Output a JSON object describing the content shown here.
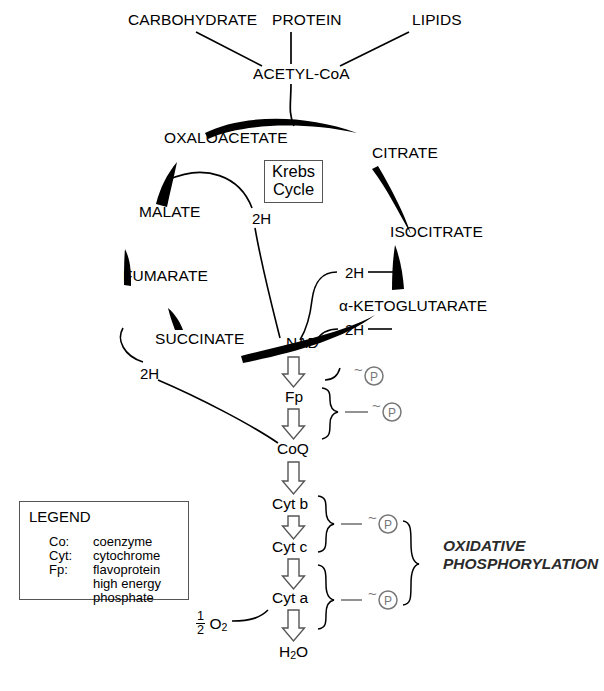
{
  "diagram": {
    "center_box": {
      "line1": "Krebs",
      "line2": "Cycle"
    },
    "inputs": [
      {
        "name": "carbohydrate",
        "label": "CARBOHYDRATE",
        "x": 128,
        "y": 19
      },
      {
        "name": "protein",
        "label": "PROTEIN",
        "x": 272,
        "y": 19
      },
      {
        "name": "lipids",
        "label": "LIPIDS",
        "x": 412,
        "y": 19
      }
    ],
    "acetyl_coa": {
      "label": "ACETYL-CoA",
      "x": 253,
      "y": 73
    },
    "cycle_intermediates": [
      {
        "name": "oxaloacetate",
        "label": "OXALOACETATE",
        "x": 164,
        "y": 137
      },
      {
        "name": "citrate",
        "label": "CITRATE",
        "x": 372,
        "y": 152
      },
      {
        "name": "malate",
        "label": "MALATE",
        "x": 139,
        "y": 211
      },
      {
        "name": "isocitrate",
        "label": "ISOCITRATE",
        "x": 390,
        "y": 231
      },
      {
        "name": "fumarate",
        "label": "FUMARATE",
        "x": 123,
        "y": 275
      },
      {
        "name": "alpha-ketoglutarate",
        "label": "α-KETOGLUTARATE",
        "x": 339,
        "y": 305
      },
      {
        "name": "succinate",
        "label": "SUCCINATE",
        "x": 155,
        "y": 338
      }
    ],
    "hydrogen_carriers": [
      {
        "name": "2h-malate",
        "label": "2H",
        "x": 252,
        "y": 218
      },
      {
        "name": "2h-isocitrate",
        "label": "2H",
        "x": 345,
        "y": 275
      },
      {
        "name": "2h-ketoglutarate",
        "label": "2H",
        "x": 345,
        "y": 332
      },
      {
        "name": "2h-succinate",
        "label": "2H",
        "x": 140,
        "y": 373
      }
    ],
    "electron_transport_chain": [
      {
        "name": "nad",
        "label": "NAD",
        "x": 286,
        "y": 342
      },
      {
        "name": "fp",
        "label": "Fp",
        "x": 293,
        "y": 396
      },
      {
        "name": "coq",
        "label": "CoQ",
        "x": 283,
        "y": 448
      },
      {
        "name": "cyt-b",
        "label": "Cyt b",
        "x": 278,
        "y": 503
      },
      {
        "name": "cyt-c",
        "label": "Cyt c",
        "x": 278,
        "y": 546
      },
      {
        "name": "cyt-a",
        "label": "Cyt a",
        "x": 278,
        "y": 597
      },
      {
        "name": "water",
        "label": "H₂O",
        "x": 286,
        "y": 651
      }
    ],
    "oxygen": {
      "label": "½ O₂",
      "numerator": "1",
      "denominator": "2",
      "species": "O",
      "subscript": "2",
      "x": 201,
      "y": 618
    },
    "high_energy_phosphates": [
      {
        "name": "phosphate-nad-fp",
        "x": 372,
        "y": 380
      },
      {
        "name": "phosphate-fp-coq",
        "x": 390,
        "y": 420
      },
      {
        "name": "phosphate-cytb-cytc",
        "x": 386,
        "y": 531
      },
      {
        "name": "phosphate-cyta",
        "x": 386,
        "y": 605
      }
    ],
    "phosphate_symbol": {
      "tilde": "~",
      "letter": "P"
    },
    "oxidative_phosphorylation": {
      "line1": "OXIDATIVE",
      "line2": "PHOSPHORYLATION",
      "x": 443,
      "y": 545
    },
    "colors": {
      "line": "#000000",
      "arrow_outline": "#555555",
      "phosphate": "#777777",
      "box_border": "#555555",
      "background": "#ffffff"
    }
  },
  "legend": {
    "title": "LEGEND",
    "entries": [
      {
        "key": "Co:",
        "value": "coenzyme"
      },
      {
        "key": "Cyt:",
        "value": "cytochrome"
      },
      {
        "key": "Fp:",
        "value": "flavoprotein"
      },
      {
        "key": "~ (P):",
        "value": "high energy"
      },
      {
        "key": "",
        "value": "phosphate"
      }
    ]
  }
}
